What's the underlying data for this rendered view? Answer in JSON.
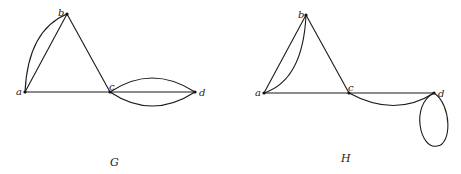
{
  "graphs": [
    {
      "name": "G",
      "vertices": [
        {
          "id": "a",
          "label": "a"
        },
        {
          "id": "b",
          "label": "b"
        },
        {
          "id": "c",
          "label": "c"
        },
        {
          "id": "d",
          "label": "d"
        }
      ],
      "edges": [
        {
          "from": "a",
          "to": "b",
          "type": "straight"
        },
        {
          "from": "a",
          "to": "b",
          "type": "curved"
        },
        {
          "from": "b",
          "to": "c",
          "type": "straight"
        },
        {
          "from": "a",
          "to": "c",
          "type": "straight"
        },
        {
          "from": "c",
          "to": "d",
          "type": "straight"
        },
        {
          "from": "c",
          "to": "d",
          "type": "curved-upper"
        },
        {
          "from": "c",
          "to": "d",
          "type": "curved-lower"
        }
      ]
    },
    {
      "name": "H",
      "vertices": [
        {
          "id": "a",
          "label": "a"
        },
        {
          "id": "b",
          "label": "b"
        },
        {
          "id": "c",
          "label": "c"
        },
        {
          "id": "d",
          "label": "d"
        }
      ],
      "edges": [
        {
          "from": "a",
          "to": "b",
          "type": "straight"
        },
        {
          "from": "a",
          "to": "b",
          "type": "curved"
        },
        {
          "from": "b",
          "to": "c",
          "type": "straight"
        },
        {
          "from": "a",
          "to": "c",
          "type": "straight"
        },
        {
          "from": "c",
          "to": "d",
          "type": "straight"
        },
        {
          "from": "c",
          "to": "d",
          "type": "curved-lower"
        },
        {
          "from": "d",
          "to": "d",
          "type": "loop"
        }
      ]
    }
  ]
}
